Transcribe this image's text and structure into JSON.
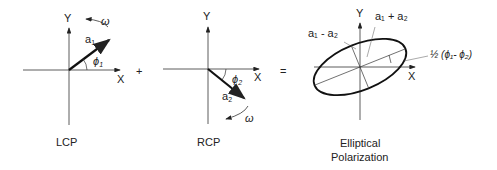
{
  "panels": [
    {
      "id": "lcp",
      "caption": "LCP",
      "axis_x": "X",
      "axis_y": "Y",
      "vector": "a",
      "vector_sub": "1",
      "angle": "ϕ",
      "angle_sub": "1",
      "rotation": "ω"
    },
    {
      "id": "rcp",
      "caption": "RCP",
      "axis_x": "X",
      "axis_y": "Y",
      "vector": "a",
      "vector_sub": "2",
      "angle": "ϕ",
      "angle_sub": "2",
      "rotation": "ω"
    },
    {
      "id": "elliptical",
      "caption_line1": "Elliptical",
      "caption_line2": "Polarization",
      "axis_x": "X",
      "axis_y": "Y",
      "major_label": "a₁ + a₂",
      "minor_label": "a₁ - a₂",
      "tilt_label": "½ (ϕ₁- ϕ₂)"
    }
  ],
  "operators": {
    "plus": "+",
    "equals": "="
  }
}
